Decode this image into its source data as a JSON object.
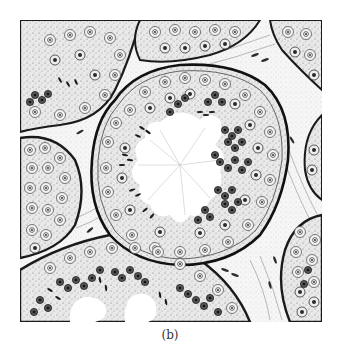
{
  "figure": {
    "panel_label": "(b)",
    "style": "black ink stipple drawing on white",
    "colors": {
      "ink": "#1a1a1a",
      "mid_gray": "#8a8a8a",
      "stroma": "#f2f2f2",
      "lumen": "#ffffff",
      "background": "#ffffff"
    }
  }
}
